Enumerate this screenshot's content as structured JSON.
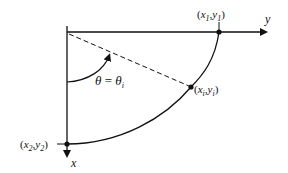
{
  "diagram": {
    "axes": {
      "horizontal_label": "y",
      "vertical_label": "x"
    },
    "points": [
      {
        "id": "p1",
        "label_x": "x",
        "label_x_sub": "1",
        "label_y": "y",
        "label_y_sub": "1"
      },
      {
        "id": "pi",
        "label_x": "x",
        "label_x_sub": "i",
        "label_y": "y",
        "label_y_sub": "i"
      },
      {
        "id": "p2",
        "label_x": "x",
        "label_x_sub": "2",
        "label_y": "y",
        "label_y_sub": "2"
      }
    ],
    "angle_label": {
      "lhs": "θ",
      "eq": " = ",
      "rhs": "θ",
      "rhs_sub": "i"
    },
    "colors": {
      "stroke": "#111111",
      "background": "#ffffff"
    }
  }
}
